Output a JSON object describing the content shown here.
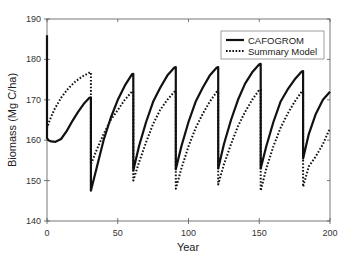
{
  "chart_data": {
    "type": "line",
    "title": "",
    "xlabel": "Year",
    "ylabel": "Biomass (Mg C/ha)",
    "xlim": [
      0,
      200
    ],
    "ylim": [
      140,
      190
    ],
    "xticks": [
      0,
      50,
      100,
      150,
      200
    ],
    "yticks": [
      140,
      150,
      160,
      170,
      180,
      190
    ],
    "grid": false,
    "legend_position": "upper right",
    "series": [
      {
        "name": "CAFOGROM",
        "style": "solid",
        "x": [
          0,
          0,
          1,
          3,
          6,
          10,
          14,
          18,
          22,
          26,
          30,
          31,
          31,
          35,
          40,
          45,
          50,
          55,
          60,
          61,
          61,
          65,
          70,
          75,
          80,
          85,
          90,
          91,
          91,
          95,
          100,
          105,
          110,
          115,
          120,
          121,
          121,
          125,
          130,
          135,
          140,
          145,
          150,
          151,
          151,
          155,
          160,
          165,
          170,
          175,
          180,
          181,
          181,
          185,
          190,
          195,
          200
        ],
        "y": [
          186,
          160.5,
          160,
          159.7,
          159.6,
          160.3,
          162.3,
          164.8,
          167,
          169,
          170.5,
          170.6,
          147.5,
          153,
          160,
          165.5,
          170,
          173.5,
          176.3,
          176.4,
          152.5,
          158.5,
          164.5,
          169.5,
          173,
          176,
          178,
          178.1,
          152.8,
          158.5,
          164.5,
          169.5,
          173,
          176,
          178,
          178.1,
          153,
          159,
          165,
          170,
          174,
          176.8,
          178.8,
          178.9,
          153,
          158.5,
          164.5,
          169.5,
          172.5,
          175,
          177,
          177.1,
          155.5,
          161.5,
          166.5,
          170,
          172
        ]
      },
      {
        "name": "Summary Model",
        "style": "dotted",
        "x": [
          0,
          0,
          2,
          5,
          10,
          15,
          20,
          25,
          30,
          31,
          31,
          35,
          40,
          45,
          50,
          55,
          60,
          61,
          61,
          65,
          70,
          75,
          80,
          85,
          90,
          91,
          91,
          95,
          100,
          105,
          110,
          115,
          120,
          121,
          121,
          125,
          130,
          135,
          140,
          145,
          150,
          151,
          151,
          155,
          160,
          165,
          170,
          175,
          180,
          181,
          181,
          185,
          190,
          195,
          200
        ],
        "y": [
          162,
          163,
          165,
          167.5,
          170.5,
          172.8,
          174.5,
          175.8,
          176.7,
          176.8,
          154,
          157.5,
          161.5,
          165,
          167.5,
          170,
          172,
          172,
          150,
          154.5,
          159.5,
          164,
          167.5,
          170,
          172,
          172,
          148,
          153,
          158.5,
          163,
          166.5,
          169.5,
          172,
          172,
          149,
          154,
          159,
          163.5,
          167,
          170,
          172.5,
          172.5,
          147.5,
          153,
          158.5,
          163,
          166.5,
          169.5,
          172,
          172,
          148.5,
          153.5,
          156,
          159,
          163
        ]
      }
    ]
  },
  "legend": {
    "items": [
      {
        "label": "CAFOGROM",
        "style": "solid"
      },
      {
        "label": "Summary Model",
        "style": "dotted"
      }
    ]
  },
  "axes": {
    "xlabel": "Year",
    "ylabel": "Biomass (Mg C/ha)",
    "x_tick_labels": [
      "0",
      "50",
      "100",
      "150",
      "200"
    ],
    "y_tick_labels": [
      "140",
      "150",
      "160",
      "170",
      "180",
      "190"
    ]
  }
}
